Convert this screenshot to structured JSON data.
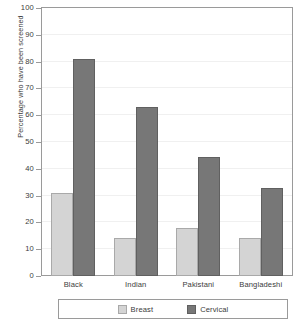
{
  "chart_data": {
    "type": "bar",
    "title": "",
    "subtitle": "",
    "xlabel": "",
    "ylabel": "Percentage who have been screened",
    "categories": [
      "Black",
      "Indian",
      "Pakistani",
      "Bangladeshi"
    ],
    "series": [
      {
        "name": "Breast",
        "color": "#d4d4d4",
        "values": [
          31,
          14,
          18,
          14
        ]
      },
      {
        "name": "Cervical",
        "color": "#777777",
        "values": [
          81,
          63,
          44.5,
          33
        ]
      }
    ],
    "ylim": [
      0,
      100
    ],
    "yticks": [
      0,
      10,
      20,
      30,
      40,
      50,
      60,
      70,
      80,
      90,
      100
    ],
    "ytick_labels": [
      "0",
      "10",
      "20",
      "30",
      "40",
      "50",
      "60",
      "70",
      "80",
      "90",
      "100"
    ],
    "grid": true,
    "legend_position": "bottom",
    "legend_entries": [
      "Breast",
      "Cervical"
    ]
  },
  "colors": {
    "breast": "#d4d4d4",
    "cervical": "#777777",
    "axis": "#9a9a9a",
    "grid": "#f0f0f0",
    "text": "#3b3b3b",
    "background": "#ffffff"
  }
}
